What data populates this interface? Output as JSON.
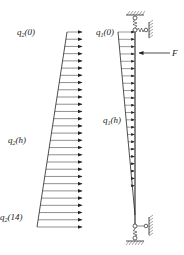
{
  "diagram": {
    "type": "structural mechanics load diagram",
    "colors": {
      "ink": "#222222",
      "background": "#ffffff"
    },
    "left_load": {
      "name": "q2 distributed load (trapezoidal)",
      "labels": {
        "top_main": "q",
        "top_sub": "2",
        "top_arg": "(0)",
        "mid_main": "q",
        "mid_sub": "2",
        "mid_arg": "(h)",
        "bottom_main": "q",
        "bottom_sub": "2",
        "bottom_arg": "(14)"
      },
      "arrow_count": 28,
      "top_y": 32,
      "bottom_y": 227,
      "tip_x": 82,
      "top_tail_x": 67,
      "bottom_tail_x": 37
    },
    "column": {
      "name": "column with spring supports",
      "x": 135,
      "top_y": 30,
      "bottom_y": 226,
      "load": {
        "labels": {
          "top_main": "q",
          "top_sub": "1",
          "top_arg": "(0)",
          "mid_main": "q",
          "mid_sub": "1",
          "mid_arg": "(h)"
        },
        "arrow_count": 26,
        "top_tail_x": 118,
        "zero_y": 215
      },
      "force": {
        "label": "F",
        "y": 53,
        "from_x": 170,
        "to_x": 138
      }
    }
  }
}
